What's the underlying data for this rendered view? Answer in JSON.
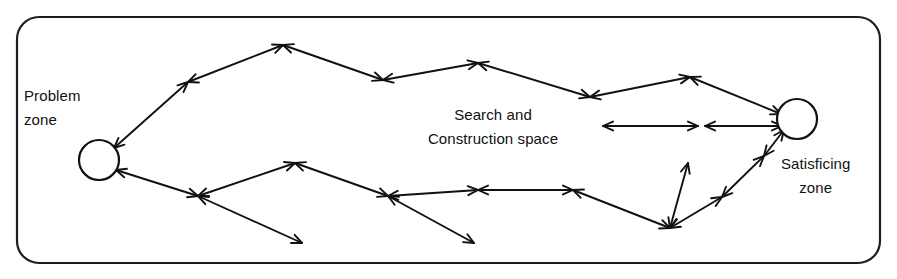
{
  "diagram": {
    "title": "Search and Construction space",
    "frame": {
      "name": "outer-rounded-rectangle",
      "x": 17,
      "y": 17,
      "width": 863,
      "height": 246,
      "radius": 22,
      "stroke_color": "#1d1d1d"
    },
    "labels": {
      "problem_zone": {
        "line1": "Problem",
        "line2": "zone"
      },
      "satisficing_zone": {
        "line1": "Satisficing",
        "line2": "zone"
      },
      "search_space": {
        "line1": "Search and",
        "line2": "Construction space"
      }
    },
    "nodes": [
      {
        "id": "problem-zone-node",
        "cx": 99,
        "cy": 160,
        "r": 20,
        "label": "Problem zone"
      },
      {
        "id": "satisficing-zone-node",
        "cx": 797,
        "cy": 119,
        "r": 20,
        "label": "Satisficing zone"
      }
    ],
    "colors": {
      "line": "#111111",
      "frame": "#1d1d1d",
      "text": "#111111",
      "background": "#ffffff"
    },
    "upper_path": {
      "name": "upper-search-trajectory",
      "points": [
        [
          114,
          148
        ],
        [
          188,
          82
        ],
        [
          283,
          45
        ],
        [
          383,
          80
        ],
        [
          478,
          63
        ],
        [
          590,
          97
        ],
        [
          690,
          77
        ],
        [
          781,
          114
        ]
      ]
    },
    "lower_path": {
      "name": "lower-search-trajectory",
      "points": [
        [
          116,
          170
        ],
        [
          198,
          196
        ],
        [
          295,
          163
        ],
        [
          388,
          196
        ],
        [
          478,
          190
        ],
        [
          573,
          190
        ],
        [
          670,
          228
        ],
        [
          722,
          197
        ],
        [
          764,
          156
        ],
        [
          784,
          130
        ]
      ]
    },
    "horizontal_pair": {
      "name": "horizontal-double-arrows",
      "y": 126,
      "segments": [
        {
          "x1": 603,
          "x2": 698
        },
        {
          "x1": 705,
          "x2": 782
        }
      ]
    },
    "branches": [
      {
        "name": "dead-end-branch-lower-left",
        "from": [
          198,
          196
        ],
        "to": [
          302,
          243
        ]
      },
      {
        "name": "dead-end-branch-lower-mid",
        "from": [
          388,
          196
        ],
        "to": [
          474,
          243
        ]
      },
      {
        "name": "vertical-branch-bottom-right",
        "from": [
          670,
          228
        ],
        "to": [
          688,
          163
        ]
      }
    ],
    "arrow_count": 22,
    "node_count": 2
  }
}
